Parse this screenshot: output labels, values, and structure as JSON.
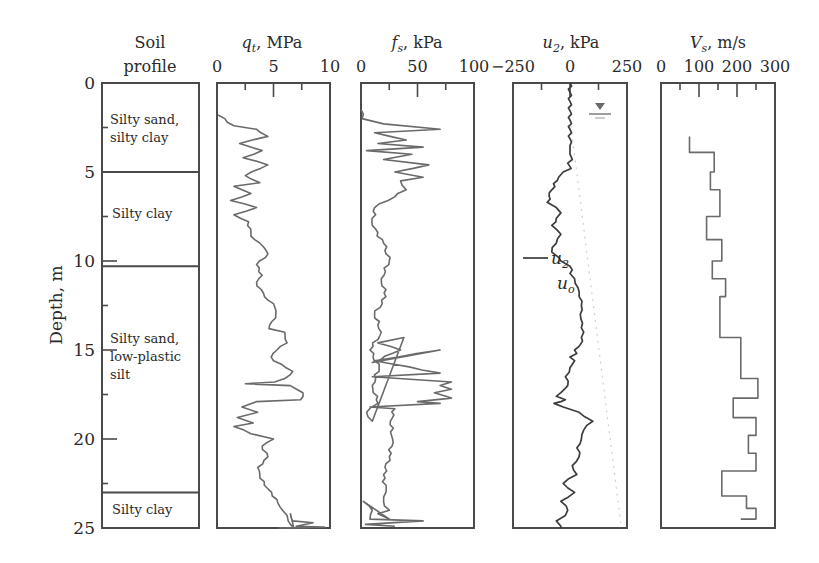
{
  "chart_data": [
    {
      "type": "table",
      "name": "soil_profile",
      "title": "Soil profile",
      "ylabel": "Depth, m",
      "ylim": [
        0,
        25
      ],
      "yticks": [
        0,
        5,
        10,
        15,
        20,
        25
      ],
      "layers": [
        {
          "top": 0,
          "bottom": 5.0,
          "label_line1": "Silty sand,",
          "label_line2": "silty clay"
        },
        {
          "top": 5.0,
          "bottom": 10.3,
          "label_line1": "Silty clay",
          "label_line2": ""
        },
        {
          "top": 10.3,
          "bottom": 23.0,
          "label_line1": "Silty sand,",
          "label_line2": "low-plastic",
          "label_line3": "silt"
        },
        {
          "top": 23.0,
          "bottom": 25.0,
          "label_line1": "Silty clay",
          "label_line2": ""
        }
      ]
    },
    {
      "type": "line",
      "name": "qt",
      "title": "q_t, MPa",
      "xlabel": "qt, MPa",
      "xlim": [
        0,
        10
      ],
      "xticks": [
        0,
        5,
        10
      ],
      "ylim": [
        0,
        25
      ],
      "x": [
        0.1,
        1.5,
        3.5,
        4.5,
        2.0,
        4.0,
        2.3,
        4.5,
        2.5,
        3.8,
        1.5,
        3.0,
        1.2,
        3.5,
        1.5,
        2.8,
        3.0,
        3.8,
        4.5,
        3.5,
        4.0,
        3.5,
        4.2,
        5.0,
        5.2,
        4.6,
        6.0,
        6.2,
        5.3,
        4.8,
        5.0,
        6.7,
        6.0,
        5.1,
        2.5,
        6.5,
        7.6,
        7.4,
        3.5,
        2.2,
        3.6,
        1.8,
        3.2,
        1.5,
        3.0,
        5.0,
        4.0,
        4.5,
        3.6,
        3.8,
        4.5,
        5.3,
        5.8,
        6.2,
        6.3,
        6.5,
        6.8,
        6.5,
        6.7,
        8.5,
        7.0,
        9.5,
        5.5,
        8.0
      ],
      "y": [
        1.8,
        2.4,
        2.6,
        3.0,
        3.4,
        3.8,
        4.2,
        4.6,
        5.2,
        5.6,
        5.8,
        6.2,
        6.6,
        7.0,
        7.4,
        7.8,
        8.6,
        9.0,
        9.6,
        10.2,
        10.8,
        11.2,
        12.0,
        12.4,
        13.0,
        13.8,
        14.0,
        14.6,
        15.0,
        15.4,
        15.6,
        16.2,
        16.6,
        16.8,
        16.9,
        17.0,
        17.4,
        17.8,
        17.9,
        18.2,
        18.5,
        18.8,
        19.1,
        19.3,
        19.7,
        20.0,
        20.4,
        21.0,
        21.6,
        22.2,
        22.8,
        23.4,
        24.0,
        24.3,
        24.6,
        24.8,
        25.0,
        24.2,
        24.6,
        24.7,
        24.9,
        24.95,
        25.0,
        25.0
      ]
    },
    {
      "type": "line",
      "name": "fs",
      "title": "f_s, kPa",
      "xlabel": "fs, kPa",
      "xlim": [
        0,
        100
      ],
      "xticks": [
        0,
        50,
        100
      ],
      "ylim": [
        0,
        25
      ],
      "x": [
        0,
        1,
        20,
        70,
        12,
        40,
        15,
        55,
        5,
        45,
        20,
        60,
        30,
        55,
        35,
        40,
        12,
        10,
        20,
        25,
        18,
        22,
        12,
        18,
        8,
        16,
        10,
        15,
        5,
        10,
        38,
        15,
        35,
        10,
        70,
        12,
        70,
        10,
        80,
        70,
        80,
        65,
        80,
        50,
        70,
        8,
        30,
        26,
        28,
        25,
        20,
        22,
        20,
        25,
        15,
        25,
        2,
        10,
        8,
        55,
        4,
        30
      ],
      "y": [
        1.5,
        2.0,
        2.3,
        2.6,
        2.8,
        3.2,
        3.4,
        3.6,
        3.8,
        4.0,
        4.3,
        4.6,
        5.0,
        5.3,
        5.5,
        6.0,
        7.0,
        8.0,
        9.0,
        10.0,
        11.0,
        12.0,
        13.0,
        14.0,
        15.0,
        16.0,
        17.0,
        18.0,
        18.5,
        19.0,
        14.3,
        14.6,
        15.0,
        15.7,
        15.0,
        15.6,
        16.3,
        16.5,
        16.8,
        17.0,
        17.2,
        17.4,
        17.7,
        17.9,
        18.0,
        18.2,
        18.3,
        19.0,
        20.0,
        21.0,
        22.0,
        23.0,
        23.5,
        24.0,
        24.2,
        24.5,
        23.5,
        24.0,
        24.5,
        24.6,
        24.8,
        24.9
      ]
    },
    {
      "type": "line",
      "name": "u2",
      "title": "u_2, kPa",
      "xlabel": "u2, kPa",
      "xlim": [
        -250,
        250
      ],
      "xticks": [
        -250,
        0,
        250
      ],
      "ylim": [
        0,
        25
      ],
      "legend": [
        {
          "label": "u2",
          "style": "solid dark"
        },
        {
          "label": "uo",
          "style": "dotted light"
        }
      ],
      "water_table_depth": 2.0,
      "x": [
        0,
        0,
        0,
        10,
        -10,
        5,
        -30,
        -50,
        -80,
        -100,
        -60,
        -40,
        -60,
        -80,
        -40,
        -60,
        -80,
        -50,
        -40,
        0,
        10,
        0,
        20,
        35,
        40,
        50,
        45,
        55,
        60,
        50,
        55,
        40,
        20,
        30,
        0,
        20,
        0,
        -20,
        -10,
        -40,
        -60,
        -20,
        -40,
        -70,
        -30,
        40,
        100,
        60,
        50,
        30,
        40,
        10,
        30,
        -30,
        20,
        -40,
        -10,
        -20,
        -60,
        -40,
        -40
      ],
      "y": [
        0,
        3.5,
        4.0,
        4.3,
        4.5,
        4.8,
        5.0,
        5.3,
        6.0,
        6.7,
        7.0,
        7.3,
        7.6,
        8.0,
        8.5,
        9.0,
        9.5,
        9.8,
        10.0,
        10.3,
        10.5,
        10.7,
        11.0,
        11.5,
        12.0,
        12.5,
        13.0,
        13.5,
        14.0,
        14.3,
        14.5,
        14.8,
        15.0,
        15.2,
        15.4,
        15.6,
        16.0,
        16.5,
        17.0,
        17.4,
        17.6,
        17.8,
        17.9,
        18.0,
        18.2,
        18.5,
        19.0,
        19.5,
        20.0,
        20.5,
        21.0,
        21.5,
        22.0,
        22.5,
        23.0,
        23.5,
        24.0,
        24.3,
        24.6,
        24.9,
        25.0
      ]
    },
    {
      "type": "line",
      "name": "Vs",
      "title": "V_s, m/s",
      "xlabel": "Vs, m/s",
      "xlim": [
        0,
        300
      ],
      "xticks": [
        0,
        100,
        200,
        300
      ],
      "ylim": [
        0,
        25
      ],
      "step_x": [
        75,
        140,
        130,
        155,
        120,
        160,
        135,
        170,
        155,
        210,
        255,
        190,
        250,
        230,
        250,
        160,
        225,
        250,
        210
      ],
      "step_y_top": [
        3.0,
        3.9,
        5.0,
        6.0,
        7.5,
        8.8,
        10.0,
        11.0,
        12.0,
        14.3,
        16.6,
        17.7,
        18.8,
        19.8,
        20.8,
        21.8,
        23.2,
        23.9,
        24.5
      ],
      "step_y_bottom": [
        3.9,
        5.0,
        6.0,
        7.5,
        8.8,
        10.0,
        11.0,
        12.0,
        14.3,
        16.6,
        17.7,
        18.8,
        19.8,
        20.8,
        21.8,
        23.2,
        23.9,
        24.5,
        24.5
      ]
    }
  ],
  "labels": {
    "soil_title_line1": "Soil",
    "soil_title_line2": "profile",
    "depth_axis": "Depth, m",
    "depth_ticks": [
      "0",
      "5",
      "10",
      "15",
      "20",
      "25"
    ],
    "qt_symbol": "q",
    "qt_sub": "t",
    "qt_unit": ", MPa",
    "qt_ticks": [
      "0",
      "5",
      "10"
    ],
    "fs_symbol": "f",
    "fs_sub": "s",
    "fs_unit": ", kPa",
    "fs_ticks": [
      "0",
      "50",
      "100"
    ],
    "u2_symbol": "u",
    "u2_sub": "2",
    "u2_unit": ", kPa",
    "u2_ticks": [
      "−250",
      "0",
      "250"
    ],
    "vs_symbol": "V",
    "vs_sub": "s",
    "vs_unit": ", m/s",
    "vs_ticks": [
      "0",
      "100",
      "200",
      "300"
    ],
    "legend_u2": "u",
    "legend_u2_sub": "2",
    "legend_uo": "u",
    "legend_uo_sub": "o",
    "soil_layers": [
      [
        "Silty sand,",
        "silty clay"
      ],
      [
        "Silty clay"
      ],
      [
        "Silty sand,",
        "low-plastic",
        "silt"
      ],
      [
        "Silty clay"
      ]
    ]
  }
}
